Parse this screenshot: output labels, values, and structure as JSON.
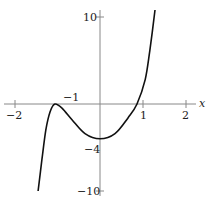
{
  "chart_data": {
    "type": "line",
    "title": "",
    "xlabel": "x",
    "ylabel": "",
    "xlim": [
      -2.3,
      2.3
    ],
    "ylim": [
      -10.5,
      11
    ],
    "grid": false,
    "legend": null,
    "x_ticks": [
      -2,
      1,
      2
    ],
    "x_tick_labels": [
      "−2",
      "1",
      "2"
    ],
    "y_ticks": [
      10,
      -10
    ],
    "y_tick_labels": [
      "10",
      "−10"
    ],
    "annotations": [
      {
        "text": "−1",
        "x": -1,
        "y": 0,
        "note": "local maximum location on x-axis"
      },
      {
        "text": "−4",
        "x": 0,
        "y": -4,
        "note": "local minimum value"
      }
    ],
    "series": [
      {
        "name": "f(x)",
        "x": [
          -1.44,
          -1.35,
          -1.26,
          -1.16,
          -1.05,
          -0.88,
          -0.65,
          -0.35,
          0.0,
          0.35,
          0.65,
          0.86,
          1.05,
          1.16,
          1.28
        ],
        "y": [
          -10,
          -6.4,
          -3.0,
          -0.9,
          0.0,
          -0.5,
          -1.8,
          -3.4,
          -4.0,
          -3.4,
          -1.6,
          0.0,
          2.8,
          6.2,
          10.8
        ]
      }
    ]
  },
  "labels": {
    "x_axis_name": "x",
    "x_neg2": "−2",
    "x_1": "1",
    "x_2": "2",
    "y_10": "10",
    "y_neg10": "−10",
    "ann_neg1": "−1",
    "ann_neg4": "−4"
  }
}
